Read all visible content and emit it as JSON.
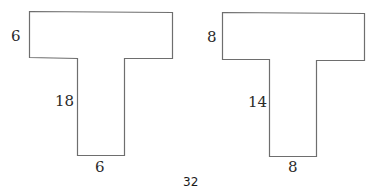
{
  "figures": [
    {
      "name": "left-t-shape",
      "labels": {
        "top_bar_height": "6",
        "stem_height": "18",
        "stem_width": "6"
      }
    },
    {
      "name": "right-t-shape",
      "labels": {
        "top_bar_height": "8",
        "stem_height": "14",
        "stem_width": "8"
      }
    }
  ],
  "caption": "32",
  "colors": {
    "outline": "#6e6e6e",
    "text": "#2a2a2a"
  }
}
